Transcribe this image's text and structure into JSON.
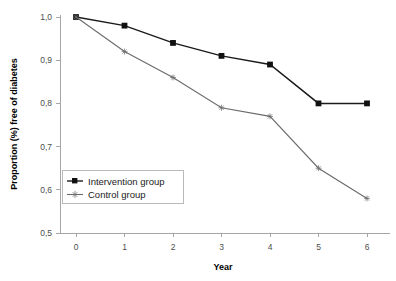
{
  "chart_data": {
    "type": "line",
    "title": "",
    "xlabel": "Year",
    "ylabel": "Proportion (%) free of diabetes",
    "x": [
      0,
      1,
      2,
      3,
      4,
      5,
      6
    ],
    "xticklabels": [
      "0",
      "1",
      "2",
      "3",
      "4",
      "5",
      "6"
    ],
    "xlim": [
      0,
      6
    ],
    "ylim": [
      0.5,
      1.0
    ],
    "yticks": [
      1.0,
      0.9,
      0.8,
      0.7,
      0.6,
      0.5
    ],
    "yticklabels": [
      "1,0",
      "0,9",
      "0,8",
      "0,7",
      "0,6",
      "0,5"
    ],
    "grid": false,
    "legend_position": "center-left",
    "series": [
      {
        "name": "Intervention group",
        "marker": "square",
        "color": "#1a1a1a",
        "values": [
          1.0,
          0.98,
          0.94,
          0.91,
          0.89,
          0.8,
          0.8
        ]
      },
      {
        "name": "Control group",
        "marker": "star",
        "color": "#6b6b6b",
        "values": [
          1.0,
          0.92,
          0.86,
          0.79,
          0.77,
          0.65,
          0.58
        ]
      }
    ]
  },
  "legend": {
    "items": [
      {
        "label": "Intervention group"
      },
      {
        "label": "Control group"
      }
    ]
  },
  "axes": {
    "x_title": "Year",
    "y_title": "Proportion (%) free of diabetes"
  }
}
